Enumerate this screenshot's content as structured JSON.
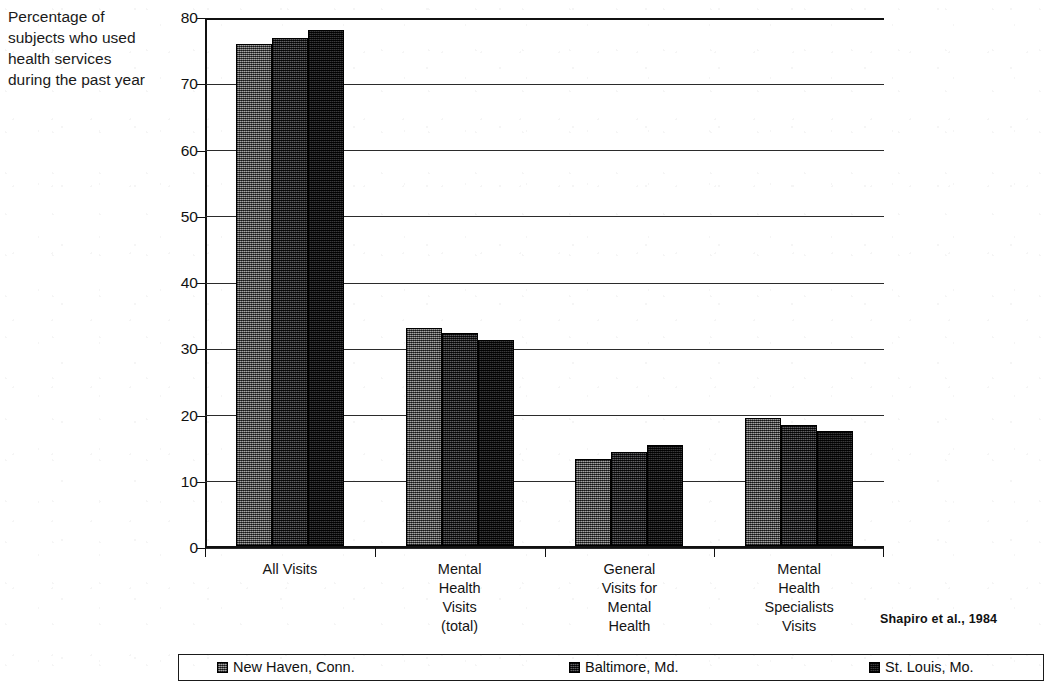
{
  "chart_data": {
    "type": "bar",
    "title": "",
    "ylabel": "Percentage of subjects who used health services during the past year",
    "xlabel": "",
    "ylim": [
      0,
      80
    ],
    "yticks": [
      0,
      10,
      20,
      30,
      40,
      50,
      60,
      70,
      80
    ],
    "ytick_labels": [
      "0",
      "10",
      "20",
      "30",
      "40",
      "50",
      "60",
      "70",
      "80"
    ],
    "grid": true,
    "legend_position": "bottom",
    "categories": [
      "All Visits",
      "Mental\nHealth\nVisits\n(total)",
      "General\nVisits for\nMental\nHealth",
      "Mental\nHealth\nSpecialists\nVisits"
    ],
    "series": [
      {
        "name": "New Haven, Conn.",
        "color": "#585858",
        "values": [
          76.0,
          33.0,
          13.2,
          19.4
        ]
      },
      {
        "name": "Baltimore, Md.",
        "color": "#26262a",
        "values": [
          77.0,
          32.2,
          14.3,
          18.4
        ]
      },
      {
        "name": "St. Louis, Mo.",
        "color": "#121214",
        "values": [
          78.2,
          31.2,
          15.3,
          17.4
        ]
      }
    ],
    "annotation": "Shapiro et al., 1984"
  },
  "legend": {
    "items": [
      {
        "label": "New Haven, Conn."
      },
      {
        "label": "Baltimore, Md."
      },
      {
        "label": "St. Louis, Mo."
      }
    ]
  }
}
